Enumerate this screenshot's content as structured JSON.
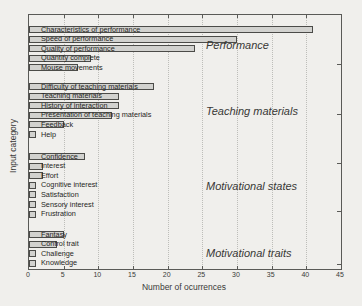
{
  "chart_data": {
    "type": "bar",
    "orientation": "horizontal",
    "title": "",
    "xlabel": "Number of ocurrences",
    "ylabel": "Input category",
    "xlim": [
      0,
      45
    ],
    "xticks": [
      0,
      5,
      10,
      15,
      20,
      25,
      30,
      35,
      40,
      45
    ],
    "grid": "vertical-dotted",
    "legend": "none",
    "bar_fill_color": "#d2d2cf",
    "bar_border_color": "#4b4b48",
    "groups": [
      {
        "label": "Performance",
        "items": [
          {
            "category": "Characteristics of performance",
            "value": 41
          },
          {
            "category": "Speed of performance",
            "value": 30
          },
          {
            "category": "Quality of performance",
            "value": 24
          },
          {
            "category": "Quantity complete",
            "value": 9
          },
          {
            "category": "Mouse movements",
            "value": 7
          }
        ]
      },
      {
        "label": "Teaching materials",
        "items": [
          {
            "category": "Difficulty of teaching materials",
            "value": 18
          },
          {
            "category": "Teaching materials",
            "value": 13
          },
          {
            "category": "History of interaction",
            "value": 13
          },
          {
            "category": "Presentation of teaching materials",
            "value": 12
          },
          {
            "category": "Feedback",
            "value": 5
          },
          {
            "category": "Help",
            "value": 1
          }
        ]
      },
      {
        "label": "Motivational states",
        "items": [
          {
            "category": "Confidence",
            "value": 8
          },
          {
            "category": "Interest",
            "value": 2
          },
          {
            "category": "Effort",
            "value": 2
          },
          {
            "category": "Cognitive interest",
            "value": 1
          },
          {
            "category": "Satisfaction",
            "value": 1
          },
          {
            "category": "Sensory interest",
            "value": 1
          },
          {
            "category": "Frustration",
            "value": 1
          }
        ]
      },
      {
        "label": "Motivational traits",
        "items": [
          {
            "category": "Fantasy",
            "value": 5
          },
          {
            "category": "Control trait",
            "value": 4
          },
          {
            "category": "Challenge",
            "value": 1
          },
          {
            "category": "Knowledge",
            "value": 1
          }
        ]
      }
    ]
  }
}
